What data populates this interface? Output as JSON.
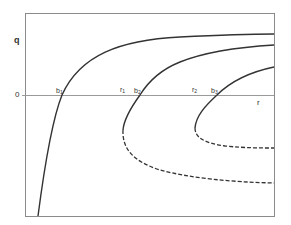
{
  "diagram": {
    "y_axis_label": "q",
    "x_axis_label": "r",
    "zero_label": "0",
    "points": [
      {
        "base": "b",
        "sub": "1"
      },
      {
        "base": "r",
        "sub": "1"
      },
      {
        "base": "b",
        "sub": "2"
      },
      {
        "base": "r",
        "sub": "2"
      },
      {
        "base": "b",
        "sub": "3"
      }
    ],
    "curves": [
      {
        "name": "curve-1",
        "style": "solid"
      },
      {
        "name": "curve-2",
        "style": "solid upper branch, dashed lower branch"
      },
      {
        "name": "curve-3",
        "style": "solid upper branch, dashed lower branch"
      }
    ],
    "colors": {
      "line": "#333333",
      "frame": "#8a8a8a",
      "axis": "#9a9a9a"
    }
  }
}
